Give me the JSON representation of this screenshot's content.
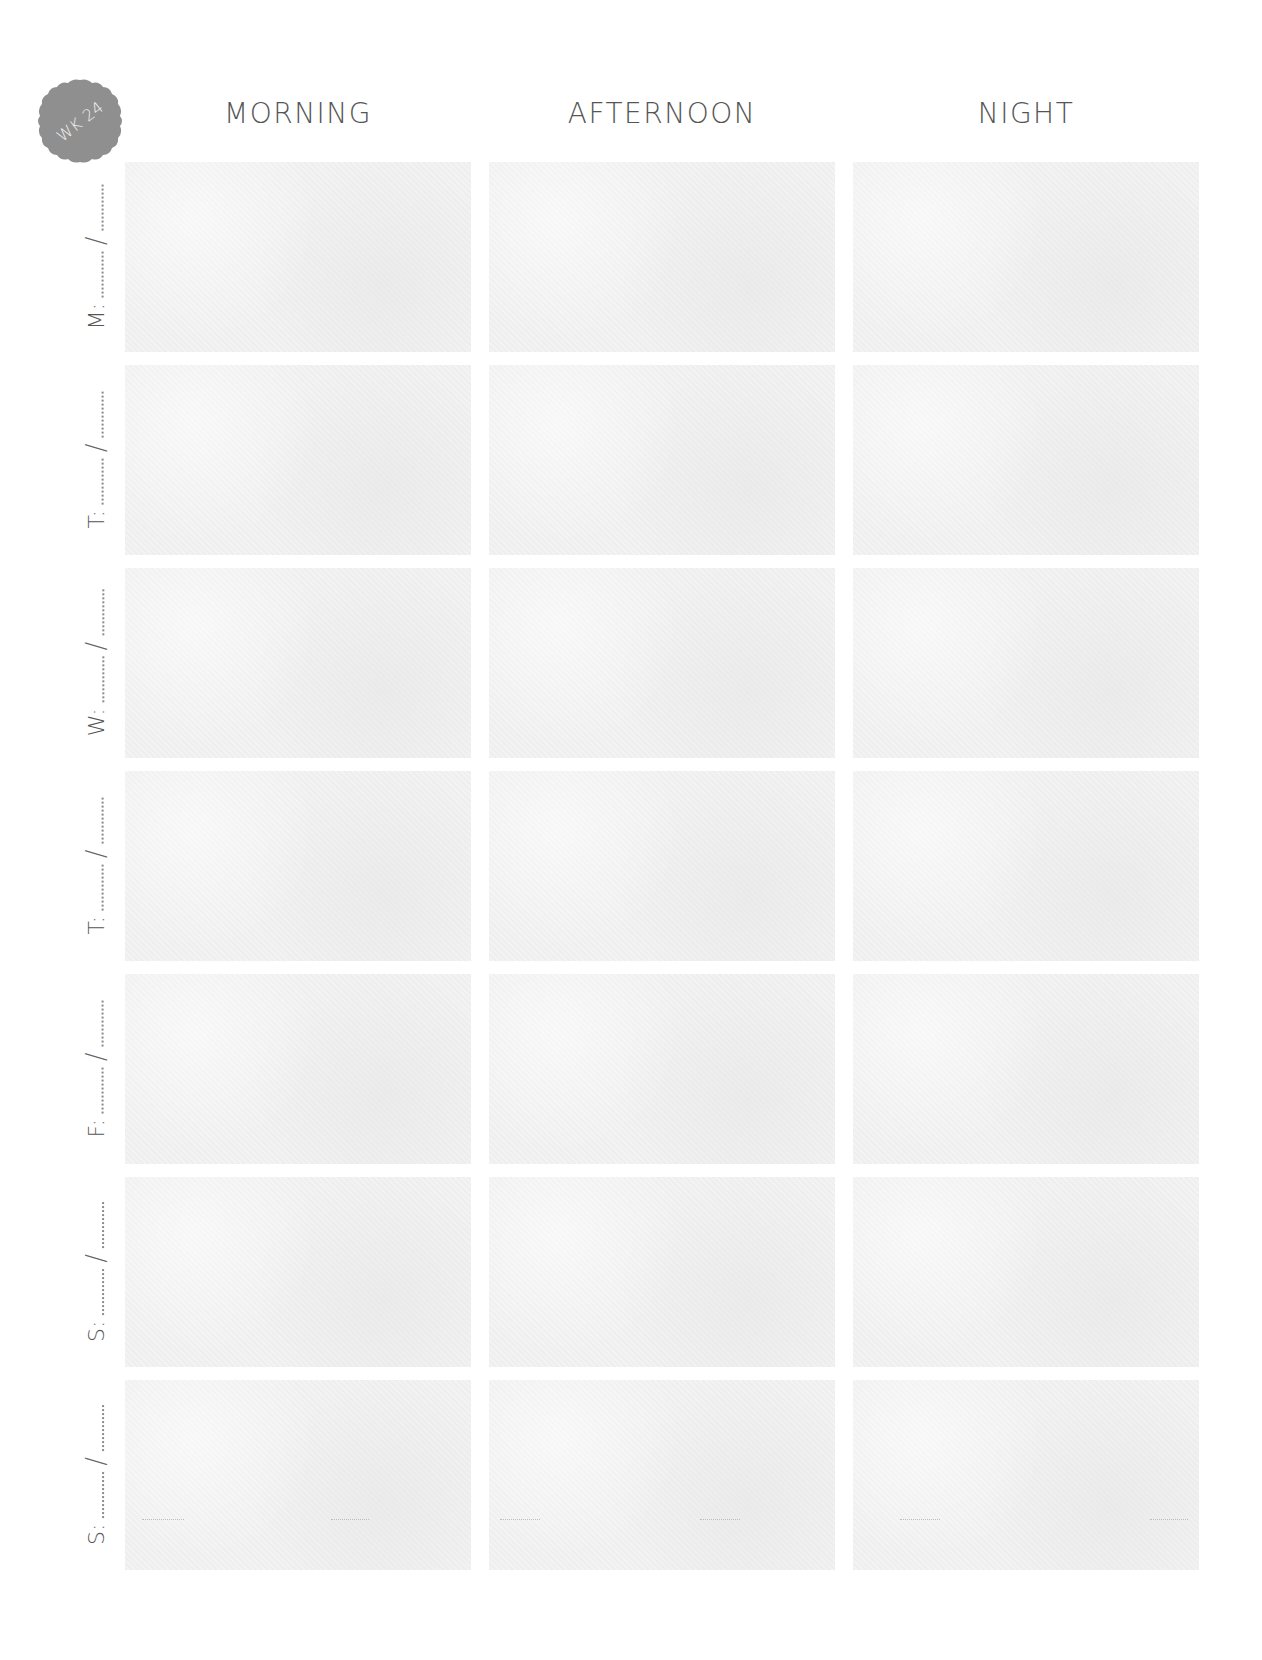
{
  "badge": {
    "label": "WK 24",
    "color": "#8f8f8f"
  },
  "columns": [
    {
      "label": "Morning"
    },
    {
      "label": "Afternoon"
    },
    {
      "label": "Night"
    }
  ],
  "rows": [
    {
      "day": "M:",
      "date_placeholder_sep": "/"
    },
    {
      "day": "T:",
      "date_placeholder_sep": "/"
    },
    {
      "day": "W:",
      "date_placeholder_sep": "/"
    },
    {
      "day": "T:",
      "date_placeholder_sep": "/"
    },
    {
      "day": "F:",
      "date_placeholder_sep": "/"
    },
    {
      "day": "S:",
      "date_placeholder_sep": "/"
    },
    {
      "day": "S:",
      "date_placeholder_sep": "/"
    }
  ],
  "colors": {
    "text": "#555555",
    "cell_fill": "#f3f3f3",
    "background": "#ffffff"
  }
}
